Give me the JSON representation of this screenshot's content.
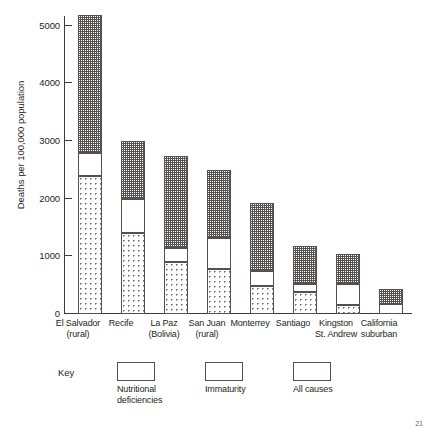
{
  "chart_data": {
    "type": "bar",
    "subtype": "stacked",
    "title": "",
    "xlabel": "",
    "ylabel": "Deaths per 100,000 population",
    "ylim": [
      0,
      5500
    ],
    "yticks": [
      0,
      1000,
      2000,
      3000,
      4000,
      5000
    ],
    "ytick_labels": [
      "0",
      "1000",
      "2000",
      "3000",
      "4000",
      "5000"
    ],
    "grid": false,
    "legend_position": "below-axes",
    "legend_title": "Key",
    "categories": [
      "El Salvador (rural)",
      "Recife",
      "La Paz (Bolivia)",
      "San Juan (rural)",
      "Monterrey",
      "Santiago",
      "Kingston St. Andrew",
      "California suburban"
    ],
    "category_lines": [
      [
        "El Salvador",
        "(rural)"
      ],
      [
        "Recife",
        ""
      ],
      [
        "La Paz",
        "(Bolivia)"
      ],
      [
        "San Juan",
        "(rural)"
      ],
      [
        "Monterrey",
        ""
      ],
      [
        "Santiago",
        ""
      ],
      [
        "Kingston",
        "St. Andrew"
      ],
      [
        "California",
        "suburban"
      ]
    ],
    "series": [
      {
        "name": "Nutritional deficiencies",
        "pattern": "light-dots",
        "values": [
          2400,
          1400,
          900,
          780,
          490,
          380,
          160,
          0
        ]
      },
      {
        "name": "Immaturity",
        "pattern": "white",
        "values": [
          400,
          600,
          250,
          540,
          260,
          140,
          360,
          170
        ]
      },
      {
        "name": "All causes",
        "pattern": "dark-dots",
        "values": [
          2400,
          1000,
          1600,
          1180,
          1180,
          660,
          520,
          260
        ]
      }
    ],
    "totals": [
      5200,
      3000,
      2750,
      2500,
      1930,
      1180,
      1040,
      430
    ]
  },
  "legend": {
    "title": "Key",
    "entries": [
      {
        "label_line1": "Nutritional",
        "label_line2": "deficiencies",
        "pattern": "light-dots"
      },
      {
        "label_line1": "Immaturity",
        "label_line2": "",
        "pattern": "white"
      },
      {
        "label_line1": "All causes",
        "label_line2": "",
        "pattern": "dark-dots"
      }
    ]
  },
  "page": {
    "number": "21"
  }
}
